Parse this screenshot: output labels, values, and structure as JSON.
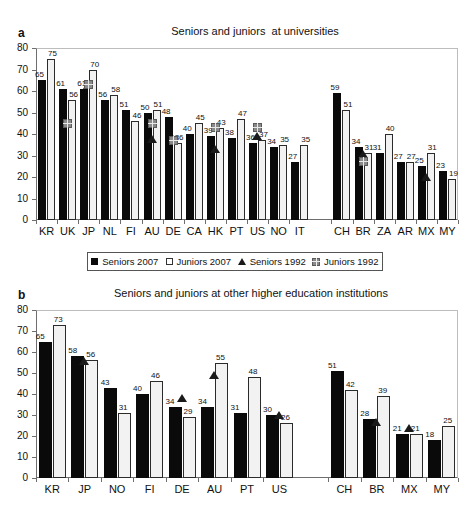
{
  "figure": {
    "panels": [
      {
        "letter": "a",
        "title": "Seniors and juniors  at universities",
        "chart_data": {
          "type": "bar",
          "title": "Seniors and juniors  at universities",
          "xlabel": "",
          "ylabel": "",
          "ylim": [
            0,
            80
          ],
          "yticks": [
            0,
            10,
            20,
            30,
            40,
            50,
            60,
            70,
            80
          ],
          "grid": false,
          "legend_position": "bottom",
          "categories": [
            "KR",
            "UK",
            "JP",
            "NL",
            "FI",
            "AU",
            "DE",
            "CA",
            "HK",
            "PT",
            "US",
            "NO",
            "IT",
            "CH",
            "BR",
            "ZA",
            "AR",
            "MX",
            "MY"
          ],
          "group_break_after": "IT",
          "series": [
            {
              "name": "Seniors 2007",
              "type": "bar-filled",
              "values": [
                65,
                61,
                61,
                56,
                51,
                50,
                48,
                40,
                39,
                38,
                36,
                34,
                27,
                59,
                34,
                31,
                27,
                25,
                23
              ]
            },
            {
              "name": "Juniors 2007",
              "type": "bar-open",
              "values": [
                75,
                56,
                70,
                58,
                46,
                51,
                36,
                45,
                43,
                47,
                37,
                35,
                35,
                51,
                31,
                40,
                27,
                31,
                19
              ]
            },
            {
              "name": "Seniors 1992",
              "type": "triangle-marker",
              "values": [
                null,
                null,
                61,
                null,
                null,
                36,
                36,
                null,
                31,
                null,
                37,
                null,
                null,
                null,
                29,
                null,
                null,
                18,
                null
              ]
            },
            {
              "name": "Juniors 1992",
              "type": "square-marker",
              "values": [
                null,
                45,
                63,
                null,
                null,
                45,
                37,
                null,
                43,
                null,
                43,
                null,
                null,
                null,
                27,
                null,
                null,
                null,
                null
              ]
            }
          ]
        }
      },
      {
        "letter": "b",
        "title": "Seniors and juniors at other higher education institutions",
        "chart_data": {
          "type": "bar",
          "title": "Seniors and juniors at other higher education institutions",
          "xlabel": "",
          "ylabel": "",
          "ylim": [
            0,
            80
          ],
          "yticks": [
            0,
            10,
            20,
            30,
            40,
            50,
            60,
            70,
            80
          ],
          "grid": false,
          "legend_position": "none",
          "categories": [
            "KR",
            "JP",
            "NO",
            "FI",
            "DE",
            "AU",
            "PT",
            "US",
            "CH",
            "BR",
            "MX",
            "MY"
          ],
          "group_break_after": "US",
          "series": [
            {
              "name": "Seniors 2007",
              "type": "bar-filled",
              "values": [
                65,
                58,
                43,
                40,
                34,
                34,
                31,
                30,
                51,
                28,
                21,
                18
              ]
            },
            {
              "name": "Juniors 2007",
              "type": "bar-open",
              "values": [
                73,
                56,
                31,
                46,
                29,
                55,
                48,
                26,
                42,
                39,
                21,
                25
              ]
            },
            {
              "name": "Seniors 1992",
              "type": "triangle-marker",
              "values": [
                null,
                54,
                null,
                null,
                36,
                47,
                null,
                28,
                null,
                25,
                22,
                null
              ]
            },
            {
              "name": "Juniors 1992",
              "type": "square-marker",
              "values": [
                null,
                null,
                null,
                null,
                null,
                null,
                null,
                null,
                null,
                null,
                null,
                null
              ]
            }
          ]
        }
      }
    ],
    "legend": {
      "items": [
        {
          "label": "Seniors 2007",
          "marker": "filled-square-icon",
          "color": "#0a0a0a"
        },
        {
          "label": "Juniors 2007",
          "marker": "open-square-icon",
          "color": "#ffffff"
        },
        {
          "label": "Seniors 1992",
          "marker": "filled-triangle-icon",
          "color": "#1a1a1a"
        },
        {
          "label": "Juniors 1992",
          "marker": "checkered-square-icon",
          "color": "#8a8a8a"
        }
      ]
    }
  }
}
